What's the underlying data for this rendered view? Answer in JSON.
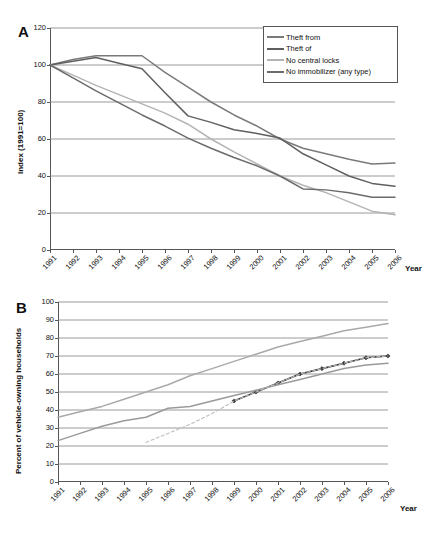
{
  "figure": {
    "panels": [
      "A",
      "B"
    ]
  },
  "panel_a": {
    "letter": "A",
    "ylabel": "Index (1991=100)",
    "xlabel": "Year",
    "legend_items": [
      {
        "label": "Theft from",
        "color": "#7a7a7a"
      },
      {
        "label": "Theft of",
        "color": "#5f5f5f"
      },
      {
        "label": "No central locks",
        "color": "#b4b4b4"
      },
      {
        "label": "No immobilizer (any type)",
        "color": "#6b6b6b"
      }
    ]
  },
  "panel_b": {
    "letter": "B",
    "ylabel": "Percent of vehicle-owning households",
    "xlabel": "Year",
    "legend_items": [
      {
        "label": "Central locking",
        "color": "#a9a9a9",
        "marker": false,
        "dashed": false
      },
      {
        "label": "Electronic immobiliser",
        "color": "#3a3a3a",
        "marker": true,
        "dashed": false
      },
      {
        "label": "Car alarm",
        "color": "#9a9a9a",
        "marker": false,
        "dashed": false
      },
      {
        "label": "Poly. (Electronic\nimmobiliser)",
        "color": "#bdbdbd",
        "marker": false,
        "dashed": true
      }
    ]
  },
  "chart_data": [
    {
      "panel": "A",
      "type": "line",
      "title": "",
      "xlabel": "Year",
      "ylabel": "Index (1991=100)",
      "ylim": [
        0,
        120
      ],
      "yticks": [
        0,
        20,
        40,
        60,
        80,
        100,
        120
      ],
      "grid": true,
      "legend_position": "top-right",
      "categories": [
        1991,
        1992,
        1993,
        1994,
        1995,
        1996,
        1997,
        1998,
        1999,
        2000,
        2001,
        2002,
        2003,
        2004,
        2005,
        2006
      ],
      "series": [
        {
          "name": "Theft from",
          "color": "#7a7a7a",
          "values": [
            100,
            103,
            105,
            105,
            105,
            96,
            88,
            80,
            73,
            67,
            60,
            55,
            52,
            49,
            46.5,
            47
          ]
        },
        {
          "name": "Theft of",
          "color": "#5f5f5f",
          "values": [
            100,
            102,
            104,
            101,
            98,
            85,
            72.5,
            69,
            65,
            63,
            60.5,
            52,
            46,
            40,
            36,
            34.5
          ]
        },
        {
          "name": "No central locks",
          "color": "#b4b4b4",
          "values": [
            100,
            94.5,
            89,
            84,
            79,
            74,
            68,
            60,
            53,
            46.5,
            40,
            35,
            31,
            26,
            21,
            19
          ]
        },
        {
          "name": "No immobilizer (any type)",
          "color": "#6b6b6b",
          "values": [
            100,
            93,
            86,
            79.5,
            73,
            67,
            60.5,
            55,
            50,
            45.5,
            40,
            33,
            32.5,
            31,
            28.5,
            28.5
          ]
        }
      ]
    },
    {
      "panel": "B",
      "type": "line",
      "title": "",
      "xlabel": "Year",
      "ylabel": "Percent of vehicle-owning households",
      "ylim": [
        0,
        100
      ],
      "yticks": [
        0,
        10,
        20,
        30,
        40,
        50,
        60,
        70,
        80,
        90,
        100
      ],
      "grid": true,
      "legend_position": "top-left",
      "categories": [
        1991,
        1992,
        1993,
        1994,
        1995,
        1996,
        1997,
        1998,
        1999,
        2000,
        2001,
        2002,
        2003,
        2004,
        2005,
        2006
      ],
      "series": [
        {
          "name": "Central locking",
          "color": "#a9a9a9",
          "marker": false,
          "values": [
            36,
            39,
            42,
            46,
            50,
            54,
            59,
            63,
            67,
            71,
            75,
            78,
            81,
            84,
            86,
            88
          ]
        },
        {
          "name": "Electronic immobiliser",
          "color": "#3a3a3a",
          "marker": true,
          "values": [
            null,
            null,
            null,
            null,
            null,
            null,
            null,
            null,
            45,
            50,
            55,
            60,
            63,
            66,
            69,
            70
          ]
        },
        {
          "name": "Car alarm",
          "color": "#9a9a9a",
          "marker": false,
          "values": [
            23,
            27,
            31,
            34,
            36,
            41,
            42,
            45,
            48,
            51,
            54,
            57,
            60,
            63,
            65,
            66
          ]
        },
        {
          "name": "Poly. (Electronic immobiliser)",
          "color": "#bdbdbd",
          "marker": false,
          "dashed": true,
          "values": [
            null,
            null,
            null,
            null,
            22,
            27,
            32,
            38,
            45,
            50,
            55,
            60,
            63,
            66,
            69,
            70
          ]
        }
      ]
    }
  ]
}
